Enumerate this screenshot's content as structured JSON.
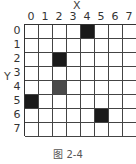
{
  "diagram": {
    "x_axis_label": "X",
    "y_axis_label": "Y",
    "columns": [
      "0",
      "1",
      "2",
      "3",
      "4",
      "5",
      "6",
      "7"
    ],
    "rows": [
      "0",
      "1",
      "2",
      "3",
      "4",
      "5",
      "6",
      "7"
    ],
    "filled_cells": [
      {
        "x": 4,
        "y": 0,
        "shade": "dark"
      },
      {
        "x": 2,
        "y": 2,
        "shade": "dark"
      },
      {
        "x": 2,
        "y": 4,
        "shade": "mid"
      },
      {
        "x": 0,
        "y": 5,
        "shade": "dark"
      },
      {
        "x": 5,
        "y": 6,
        "shade": "dark"
      }
    ],
    "caption": "图 2-4"
  }
}
